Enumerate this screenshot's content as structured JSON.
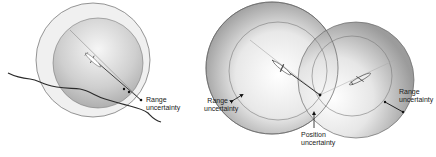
{
  "figures": [
    {
      "id": "single-sensor",
      "labels": [
        {
          "name": "range-uncertainty-label",
          "line1": "Range",
          "line2": "uncertainty"
        }
      ]
    },
    {
      "id": "two-sensor-intersection",
      "labels": [
        {
          "name": "range-uncertainty-left-label",
          "line1": "Range",
          "line2": "uncertainty"
        },
        {
          "name": "position-uncertainty-label",
          "line1": "Position",
          "line2": "uncertainty"
        },
        {
          "name": "range-uncertainty-right-label",
          "line1": "Range",
          "line2": "uncertainty"
        }
      ]
    }
  ],
  "colors": {
    "circle_stroke": "#6a6a6a",
    "terrain_line": "#2a2a2a",
    "shade_center": "#ffffff",
    "shade_edge": "#8c8c8c",
    "text": "#222222"
  },
  "icons": [
    "aircraft-icon-left",
    "aircraft-icon-middle",
    "aircraft-icon-right"
  ]
}
